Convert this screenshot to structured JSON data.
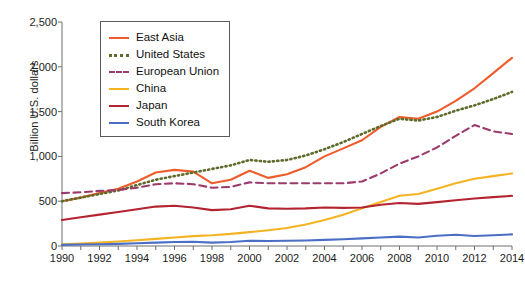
{
  "chart_data": {
    "type": "line",
    "title": "",
    "xlabel": "",
    "ylabel": "Billion U.S. dollars",
    "x": [
      1990,
      1991,
      1992,
      1993,
      1994,
      1995,
      1996,
      1997,
      1998,
      1999,
      2000,
      2001,
      2002,
      2003,
      2004,
      2005,
      2006,
      2007,
      2008,
      2009,
      2010,
      2011,
      2012,
      2013,
      2014
    ],
    "xticks": [
      "1990",
      "1992",
      "1994",
      "1996",
      "1998",
      "2000",
      "2002",
      "2004",
      "2006",
      "2008",
      "2010",
      "2012",
      "2014"
    ],
    "yticks": [
      "0",
      "500",
      "1,000",
      "1,500",
      "2,000",
      "2,500"
    ],
    "ylim": [
      0,
      2500
    ],
    "xlim": [
      1990,
      2014
    ],
    "grid": false,
    "legend_position": "top-left",
    "series": [
      {
        "name": "East Asia",
        "color": "#ee5c2b",
        "style": "solid",
        "values": [
          500,
          540,
          590,
          640,
          720,
          820,
          850,
          830,
          700,
          740,
          840,
          760,
          800,
          880,
          1000,
          1090,
          1180,
          1330,
          1440,
          1420,
          1500,
          1620,
          1760,
          1930,
          2100
        ]
      },
      {
        "name": "United States",
        "color": "#5d6b2b",
        "style": "dotted",
        "values": [
          500,
          540,
          580,
          620,
          680,
          740,
          780,
          820,
          860,
          900,
          960,
          940,
          960,
          1010,
          1080,
          1160,
          1250,
          1340,
          1420,
          1400,
          1440,
          1510,
          1570,
          1640,
          1720
        ]
      },
      {
        "name": "European Union",
        "color": "#9b3a6b",
        "style": "dashed",
        "values": [
          590,
          600,
          615,
          625,
          650,
          690,
          700,
          690,
          650,
          660,
          710,
          700,
          700,
          700,
          700,
          700,
          720,
          810,
          920,
          1000,
          1100,
          1230,
          1350,
          1280,
          1250
        ]
      },
      {
        "name": "China",
        "color": "#f4b323",
        "style": "solid",
        "values": [
          20,
          28,
          38,
          50,
          65,
          80,
          95,
          110,
          120,
          135,
          155,
          175,
          200,
          240,
          290,
          350,
          420,
          490,
          560,
          580,
          640,
          700,
          750,
          780,
          810
        ]
      },
      {
        "name": "Japan",
        "color": "#b32430",
        "style": "solid",
        "values": [
          290,
          320,
          350,
          380,
          410,
          440,
          450,
          430,
          400,
          410,
          450,
          420,
          415,
          420,
          430,
          425,
          430,
          460,
          480,
          470,
          490,
          510,
          530,
          545,
          560
        ]
      },
      {
        "name": "South Korea",
        "color": "#4a6fc4",
        "style": "solid",
        "values": [
          12,
          16,
          20,
          24,
          30,
          38,
          45,
          48,
          38,
          45,
          58,
          55,
          58,
          62,
          68,
          75,
          85,
          95,
          105,
          95,
          115,
          125,
          112,
          120,
          130
        ]
      }
    ]
  },
  "legend": {
    "items": [
      {
        "label": "East Asia"
      },
      {
        "label": "United States"
      },
      {
        "label": "European Union"
      },
      {
        "label": "China"
      },
      {
        "label": "Japan"
      },
      {
        "label": "South Korea"
      }
    ]
  }
}
